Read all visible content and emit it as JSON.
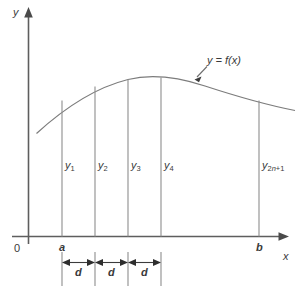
{
  "figure": {
    "axes": {
      "y_label": "y",
      "x_label": "x",
      "origin_label": "0"
    },
    "bounds": {
      "lower_label": "a",
      "upper_label": "b"
    },
    "curve": {
      "annotation": "y = f(x)",
      "color": "#7c7c7c"
    },
    "ordinates": [
      {
        "name": "ordinate-y1",
        "label_base": "y",
        "label_sub": "1",
        "x": 62
      },
      {
        "name": "ordinate-y2",
        "label_base": "y",
        "label_sub": "2",
        "x": 95
      },
      {
        "name": "ordinate-y3",
        "label_base": "y",
        "label_sub": "3",
        "x": 128
      },
      {
        "name": "ordinate-y4",
        "label_base": "y",
        "label_sub": "4",
        "x": 161
      },
      {
        "name": "ordinate-y2n1",
        "label_base": "y",
        "label_sub": "2n+1",
        "x": 259
      }
    ],
    "spacings": [
      {
        "name": "spacing-d-1",
        "label": "d"
      },
      {
        "name": "spacing-d-2",
        "label": "d"
      },
      {
        "name": "spacing-d-3",
        "label": "d"
      }
    ],
    "colors": {
      "axis": "#5e5e5e",
      "ordinate": "#8d8d8d",
      "curve": "#7c7c7c",
      "dimension": "#3c3c3c",
      "text": "#3a3a3a",
      "background": "#ffffff"
    }
  }
}
